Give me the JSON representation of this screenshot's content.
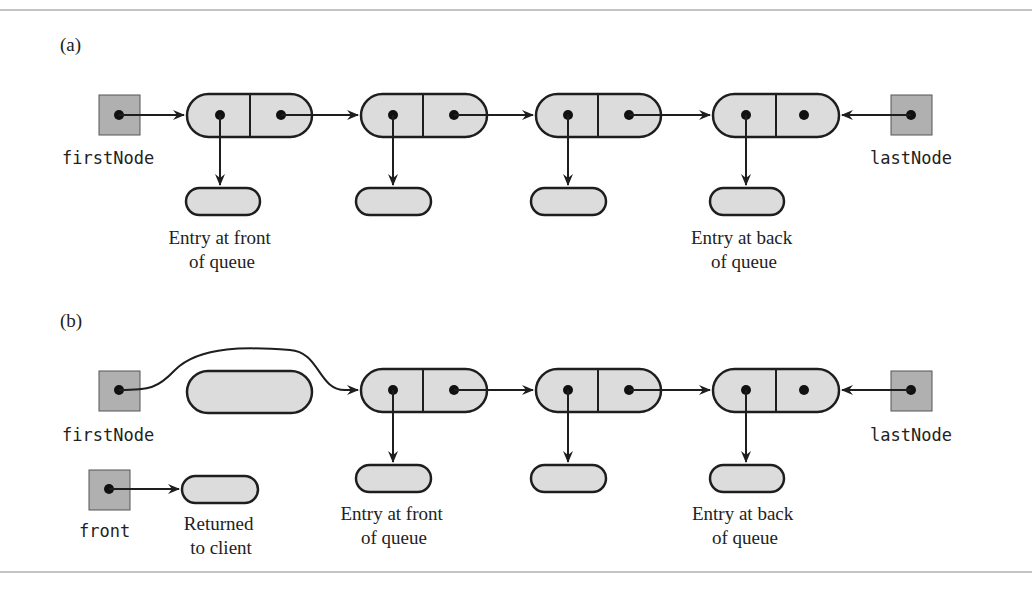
{
  "colors": {
    "stroke": "#1e1e1e",
    "node_fill": "#dcdcdc",
    "ref_fill": "#b0b0b0",
    "rule": "#8a8a8a",
    "background": "#ffffff"
  },
  "panel_a": {
    "label": "(a)",
    "first_ref_label": "firstNode",
    "last_ref_label": "lastNode",
    "front_caption": [
      "Entry at front",
      "of queue"
    ],
    "back_caption": [
      "Entry at back",
      "of queue"
    ],
    "node_count": 4
  },
  "panel_b": {
    "label": "(b)",
    "first_ref_label": "firstNode",
    "last_ref_label": "lastNode",
    "front_var_label": "front",
    "returned_caption": [
      "Returned",
      "to client"
    ],
    "front_caption": [
      "Entry at front",
      "of queue"
    ],
    "back_caption": [
      "Entry at back",
      "of queue"
    ],
    "node_count": 3,
    "detached_node": true
  }
}
